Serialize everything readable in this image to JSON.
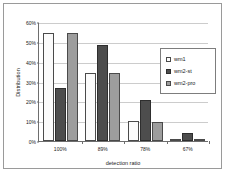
{
  "chart_data": {
    "type": "bar",
    "title": "",
    "xlabel": "detection ratio",
    "ylabel": "Distribution",
    "categories": [
      "100%",
      "89%",
      "78%",
      "67%"
    ],
    "series": [
      {
        "name": "wm1",
        "values": [
          54.5,
          34.5,
          9.9,
          0.8
        ],
        "swatch": "#fbfbfb"
      },
      {
        "name": "wm2-st",
        "values": [
          26.8,
          48.5,
          20.9,
          4.0
        ],
        "swatch": "#4d4d4d"
      },
      {
        "name": "wm2-pro",
        "values": [
          54.5,
          34.5,
          9.7,
          0.8
        ],
        "swatch": "#9d9d9d"
      }
    ],
    "ylim": [
      0,
      60
    ],
    "yticks": [
      "0%",
      "10%",
      "20%",
      "30%",
      "40%",
      "50%",
      "60%"
    ],
    "ytick_values": [
      0,
      10,
      20,
      30,
      40,
      50,
      60
    ],
    "grid": true,
    "legend_position": "upper-right-inside"
  }
}
